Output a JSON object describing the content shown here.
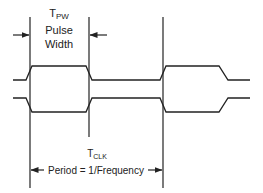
{
  "diagram": {
    "type": "timing-diagram",
    "colors": {
      "line": "#222222",
      "background": "#ffffff"
    },
    "pulse_width": {
      "symbol": "T",
      "subscript": "PW",
      "line1": "Pulse",
      "line2": "Width"
    },
    "clock_period": {
      "symbol": "T",
      "subscript": "CLK",
      "label": "Period = 1/Frequency"
    },
    "signals": [
      {
        "name": "clock",
        "pattern": [
          "low",
          "high",
          "low",
          "high",
          "low"
        ]
      },
      {
        "name": "clock-inverted",
        "pattern": [
          "high",
          "low",
          "high",
          "low",
          "high"
        ]
      }
    ]
  }
}
